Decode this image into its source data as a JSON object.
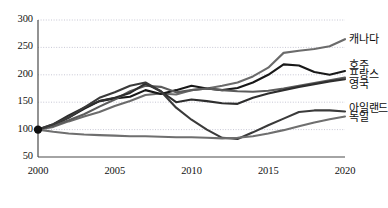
{
  "chart_data": {
    "type": "line",
    "title": "",
    "subtitle": "",
    "xlabel": "",
    "ylabel": "",
    "xlim": [
      2000,
      2020
    ],
    "ylim": [
      50,
      300
    ],
    "yticks": [
      50,
      100,
      150,
      200,
      250,
      300
    ],
    "xticks": [
      2000,
      2005,
      2010,
      2015,
      2020
    ],
    "grid": true,
    "grid_style": "dotted-horizontal",
    "legend_position": "right-inline",
    "index_base": {
      "year": 2000,
      "value": 100,
      "marker": "filled-circle"
    },
    "x": [
      2000,
      2001,
      2002,
      2003,
      2004,
      2005,
      2006,
      2007,
      2008,
      2009,
      2010,
      2011,
      2012,
      2013,
      2014,
      2015,
      2016,
      2017,
      2018,
      2019,
      2020
    ],
    "series": [
      {
        "name": "캐나다",
        "color": "#6b6b6b",
        "values": [
          100,
          105,
          115,
          124,
          132,
          143,
          152,
          163,
          166,
          164,
          172,
          175,
          180,
          186,
          197,
          213,
          240,
          244,
          247,
          252,
          265
        ]
      },
      {
        "name": "호주",
        "color": "#181818",
        "values": [
          100,
          108,
          122,
          138,
          152,
          157,
          160,
          172,
          165,
          172,
          180,
          175,
          172,
          176,
          186,
          200,
          219,
          217,
          205,
          200,
          207
        ]
      },
      {
        "name": "프랑스",
        "color": "#5c5c5c",
        "values": [
          100,
          107,
          117,
          128,
          142,
          155,
          170,
          180,
          178,
          168,
          172,
          175,
          172,
          170,
          169,
          171,
          175,
          180,
          185,
          190,
          195
        ]
      },
      {
        "name": "영국",
        "color": "#2e2e2e",
        "values": [
          100,
          110,
          126,
          140,
          152,
          158,
          167,
          184,
          170,
          150,
          155,
          152,
          148,
          147,
          158,
          166,
          172,
          178,
          183,
          188,
          192
        ]
      },
      {
        "name": "아일랜드",
        "color": "#3a3a3a",
        "values": [
          100,
          110,
          122,
          140,
          158,
          168,
          180,
          186,
          170,
          140,
          118,
          100,
          85,
          83,
          95,
          108,
          120,
          132,
          135,
          135,
          133
        ]
      },
      {
        "name": "독일",
        "color": "#6f6f6f",
        "values": [
          100,
          96,
          93,
          91,
          90,
          89,
          88,
          88,
          87,
          86,
          86,
          85,
          84,
          85,
          88,
          93,
          99,
          106,
          113,
          119,
          124
        ]
      }
    ],
    "annotations": [
      {
        "text": "캐나다",
        "x": 2020.6,
        "y": 262
      },
      {
        "text": "호주",
        "x": 2020.6,
        "y": 214
      },
      {
        "text": "프랑스",
        "x": 2020.6,
        "y": 197
      },
      {
        "text": "영국",
        "x": 2020.6,
        "y": 180
      },
      {
        "text": "아일랜드",
        "x": 2020.6,
        "y": 136
      },
      {
        "text": "독일",
        "x": 2020.6,
        "y": 120
      }
    ]
  },
  "axes": {
    "ytick_labels": [
      "300",
      "250",
      "200",
      "150",
      "100",
      "50"
    ],
    "xtick_labels": [
      "2000",
      "2005",
      "2010",
      "2015",
      "2020"
    ]
  }
}
